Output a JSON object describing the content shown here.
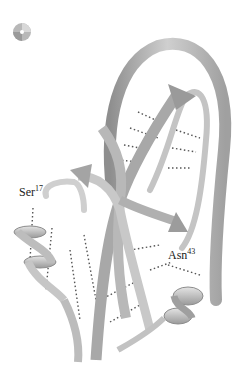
{
  "figure": {
    "type": "protein ribbon diagram",
    "icon": "cd-disc-icon",
    "labels": [
      {
        "residue": "Ser",
        "number": "17"
      },
      {
        "residue": "Asn",
        "number": "43"
      }
    ],
    "colors": {
      "ribbon_light": "#d8d8d8",
      "ribbon_mid": "#b4b4b4",
      "ribbon_dark": "#8a8a8a",
      "hbond": "#555555",
      "text": "#222222"
    }
  }
}
